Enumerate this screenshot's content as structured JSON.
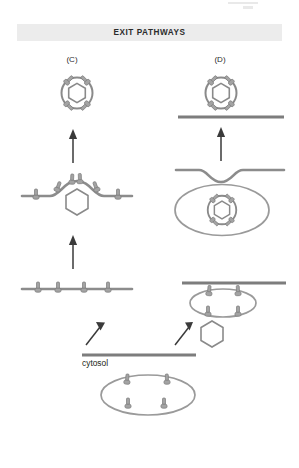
{
  "figure": {
    "header": {
      "title": "EXIT PATHWAYS",
      "band_color": "#ececec"
    },
    "panels": [
      {
        "id": "C",
        "label": "(C)"
      },
      {
        "id": "D",
        "label": "(D)"
      }
    ],
    "labels": {
      "cytosol": "cytosol"
    },
    "colors": {
      "membrane": "#8c8c8c",
      "membrane_dark": "#7d7d7d",
      "vesicle": "#8a8a8a",
      "receptor_fill": "#a3a3a3",
      "receptor_stroke": "#7a7a7a",
      "capsid_fill": "#ffffff",
      "capsid_stroke": "#8a8a8a",
      "arrow": "#3a3a3a",
      "background": "#ffffff",
      "text": "#231f20"
    },
    "icons": {
      "enveloped_virion": "enveloped-virion-icon",
      "naked_capsid": "hexagon-capsid-icon",
      "receptor_spike": "glycoprotein-spike-icon",
      "membrane_line": "membrane-line-icon",
      "up_arrow": "up-arrow-icon",
      "diagonal_arrow": "diagonal-arrow-icon"
    },
    "panel_c_stages": [
      {
        "order": 1,
        "name": "plasma-membrane-with-spikes",
        "description": "flat membrane bearing four glycoprotein spikes"
      },
      {
        "order": 2,
        "name": "budding-virion",
        "description": "membrane curving outward around hexagonal capsid with spikes"
      },
      {
        "order": 3,
        "name": "released-enveloped-virion",
        "description": "free enveloped particle with hexagonal capsid and four spikes"
      }
    ],
    "panel_d_stages": [
      {
        "order": 1,
        "name": "vesicle-with-spikes-and-free-capsid",
        "description": "internal vesicle bearing spikes beside free hexagonal capsid"
      },
      {
        "order": 2,
        "name": "enveloped-virion-in-vacuole",
        "description": "enveloped virion inside membrane-bound compartment below invaginated membrane"
      },
      {
        "order": 3,
        "name": "released-enveloped-virion",
        "description": "free enveloped particle with hexagonal capsid and four spikes"
      }
    ],
    "cytosol_stage": {
      "name": "cytosolic-vesicle-with-spikes",
      "description": "oval vesicle in cytosol bearing four glycoprotein spikes"
    }
  }
}
